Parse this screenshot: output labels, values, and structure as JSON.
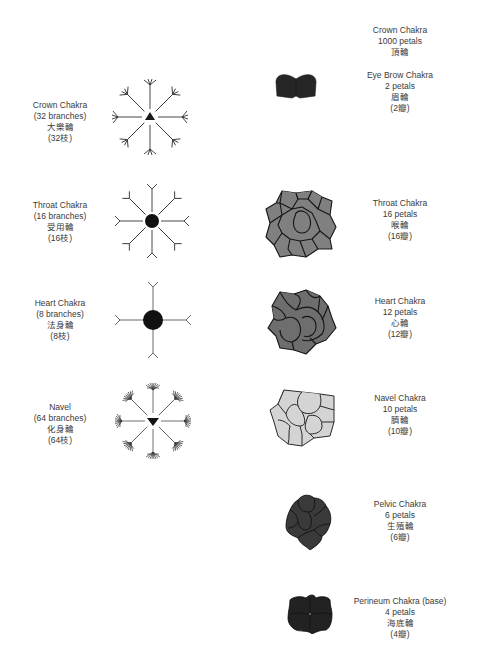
{
  "left_column": {
    "title": "Channel branches",
    "items": [
      {
        "name": "Crown Chakra",
        "count": "(32 branches)",
        "chinese": "大樂輪",
        "chinese_count": "(32枝)",
        "center_shape": "triangle-up"
      },
      {
        "name": "Throat Chakra",
        "count": "(16 branches)",
        "chinese": "受用輪",
        "chinese_count": "(16枝)",
        "center_shape": "circle"
      },
      {
        "name": "Heart Chakra",
        "count": "(8 branches)",
        "chinese": "法身輪",
        "chinese_count": "(8枝)",
        "center_shape": "circle-large"
      },
      {
        "name": "Navel",
        "count": "(64 branches)",
        "chinese": "化身輪",
        "chinese_count": "(64枝)",
        "center_shape": "triangle-down"
      }
    ]
  },
  "right_column": {
    "items": [
      {
        "name": "Crown Chakra",
        "count": "1000 petals",
        "chinese": "頂輪",
        "chinese_count": ""
      },
      {
        "name": "Eye Brow Chakra",
        "count": "2 petals",
        "chinese": "眉輪",
        "chinese_count": "(2瓣)",
        "color": "#2a2a2a"
      },
      {
        "name": "Throat Chakra",
        "count": "16 petals",
        "chinese": "喉輪",
        "chinese_count": "(16瓣)",
        "color": "#808080"
      },
      {
        "name": "Heart Chakra",
        "count": "12 petals",
        "chinese": "心輪",
        "chinese_count": "(12瓣)",
        "color": "#6e6e6e"
      },
      {
        "name": "Navel Chakra",
        "count": "10 petals",
        "chinese": "臍輪",
        "chinese_count": "(10瓣)",
        "color": "#d4d4d4"
      },
      {
        "name": "Pelvic Chakra",
        "count": "6 petals",
        "chinese": "生殖輪",
        "chinese_count": "(6瓣)",
        "color": "#3a3a3a"
      },
      {
        "name": "Perineum Chakra (base)",
        "count": "4 petals",
        "chinese": "海底輪",
        "chinese_count": "(4瓣)",
        "color": "#222222"
      }
    ]
  }
}
